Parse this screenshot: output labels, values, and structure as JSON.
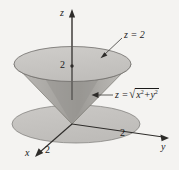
{
  "figure": {
    "background_color": "#f4f3f1",
    "ink_color": "#1a1a1a",
    "axes": {
      "z_label": "z",
      "x_label": "x",
      "y_label": "y"
    },
    "ticks": {
      "z_value": "2",
      "x_value": "2",
      "y_value": "2"
    },
    "annotations": {
      "plane_label": "z = 2",
      "cone_equation_lhs": "z =",
      "cone_equation_radicand_x": "x",
      "cone_equation_radicand_plus": "+",
      "cone_equation_radicand_y": "y",
      "cone_equation_exponent": "2",
      "sqrt_symbol": "√"
    },
    "colors": {
      "cone_top_fill": "#c9c7c4",
      "cone_body_light": "#b9b7b4",
      "cone_body_dark": "#9a9894",
      "base_disk_fill": "#c4c2bf",
      "outline": "#6e6c69"
    }
  }
}
